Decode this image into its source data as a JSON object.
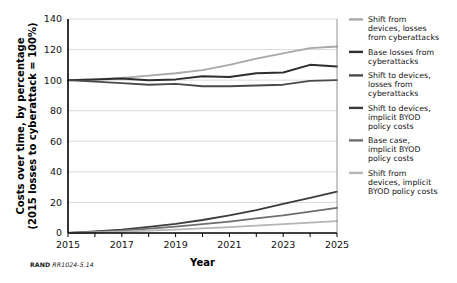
{
  "figure": {
    "credit_org": "RAND",
    "credit_number": "RR1024-5.14"
  },
  "chart_data": {
    "type": "line",
    "title": "",
    "xlabel": "Year",
    "ylabel": "Costs over time, by percentage (2015 losses to cyberattack = 100%)",
    "ylabel_line1": "Costs over time, by percentage",
    "ylabel_line2": "(2015 losses to cyberattack = 100%)",
    "x": [
      2015,
      2016,
      2017,
      2018,
      2019,
      2020,
      2021,
      2022,
      2023,
      2024,
      2025
    ],
    "xlim": [
      2015,
      2025
    ],
    "ylim": [
      0,
      140
    ],
    "yticks": [
      0,
      20,
      40,
      60,
      80,
      100,
      120,
      140
    ],
    "xticks": [
      2015,
      2016,
      2017,
      2018,
      2019,
      2020,
      2021,
      2022,
      2023,
      2024,
      2025
    ],
    "xticklabels": [
      "2015",
      "",
      "2017",
      "",
      "2019",
      "",
      "2021",
      "",
      "2023",
      "",
      "2025"
    ],
    "grid": "horizontal",
    "legend_position": "right",
    "series": [
      {
        "name": "Shift from devices, losses from cyberattacks",
        "color": "#a8a8a8",
        "width": 1.8,
        "values": [
          100,
          100.5,
          101.5,
          103,
          104.5,
          106.5,
          110,
          114,
          117.5,
          121,
          122
        ]
      },
      {
        "name": "Base losses from cyberattacks",
        "color": "#2e2e2e",
        "width": 2.0,
        "values": [
          100,
          100.5,
          101,
          100,
          100.5,
          102.5,
          102,
          104.5,
          105,
          110,
          109
        ]
      },
      {
        "name": "Shift to devices, losses from cyberattacks",
        "color": "#4a4a4a",
        "width": 1.8,
        "values": [
          100,
          99,
          98,
          97,
          97.5,
          96,
          96,
          96.5,
          97,
          99.5,
          100
        ]
      },
      {
        "name": "Shift to devices, implicit BYOD policy costs",
        "color": "#3c3c3c",
        "width": 1.8,
        "values": [
          0,
          1,
          2.2,
          4,
          6,
          8.5,
          11.5,
          15,
          19,
          23,
          27
        ]
      },
      {
        "name": "Base case, implicit BYOD policy costs",
        "color": "#6e6e6e",
        "width": 1.8,
        "values": [
          0,
          0.7,
          1.6,
          2.8,
          4.2,
          5.8,
          7.5,
          9.5,
          11.5,
          14,
          16.5
        ]
      },
      {
        "name": "Shift from devices, implicit BYOD policy costs",
        "color": "#b5b5b5",
        "width": 1.8,
        "values": [
          0,
          0.4,
          0.9,
          1.5,
          2.2,
          3,
          3.9,
          4.8,
          5.8,
          6.8,
          7.8
        ]
      }
    ]
  }
}
